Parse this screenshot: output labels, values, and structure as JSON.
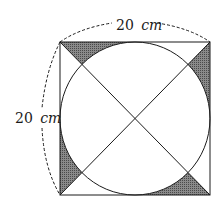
{
  "figure": {
    "type": "geometry-diagram",
    "square": {
      "side_label": "20 cm",
      "side_value": 20,
      "unit": "cm"
    },
    "labels": {
      "top": {
        "number": "20",
        "unit": "cm"
      },
      "left": {
        "number": "20",
        "unit": "cm"
      }
    },
    "colors": {
      "stroke": "#1a1a1a",
      "shade": "#6a6a6a",
      "background": "#ffffff"
    },
    "shaded_regions": [
      "top-left",
      "top-right",
      "bottom-left",
      "bottom-right"
    ]
  }
}
